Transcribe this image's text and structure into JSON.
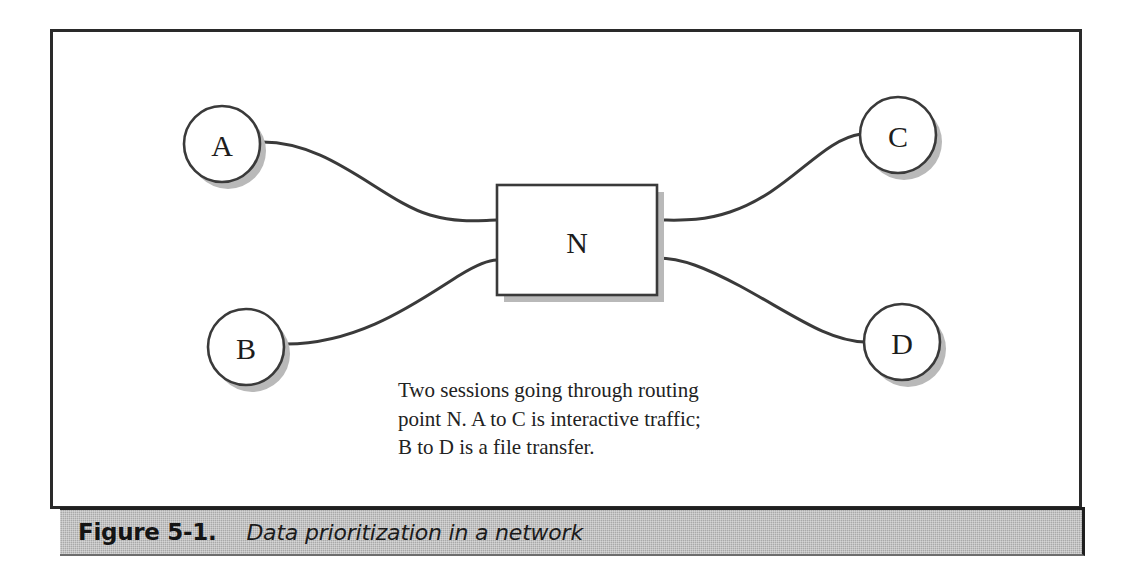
{
  "figure": {
    "caption_label": "Figure 5-1.",
    "caption_title": "Data prioritization in a network",
    "note_lines": [
      "Two sessions going through routing",
      "point N. A to C is interactive traffic;",
      "B to D is a file transfer."
    ],
    "colors": {
      "frame_border": "#2a2a2a",
      "caption_band": "#a9a9a9",
      "line": "#3a3a3a",
      "shadow": "#b9b9b9",
      "text": "#1d1d1d",
      "page_background": "#ffffff"
    }
  },
  "diagram": {
    "type": "network-diagram",
    "nodes": [
      {
        "id": "A",
        "label": "A",
        "shape": "circle",
        "cx": 222,
        "cy": 144,
        "r": 38
      },
      {
        "id": "B",
        "label": "B",
        "shape": "circle",
        "cx": 246,
        "cy": 347,
        "r": 38
      },
      {
        "id": "C",
        "label": "C",
        "shape": "circle",
        "cx": 898,
        "cy": 135,
        "r": 38
      },
      {
        "id": "D",
        "label": "D",
        "shape": "circle",
        "cx": 902,
        "cy": 342,
        "r": 38
      },
      {
        "id": "N",
        "label": "N",
        "shape": "rectangle",
        "x": 497,
        "y": 185,
        "width": 160,
        "height": 110
      }
    ],
    "links": [
      {
        "id": "A-N",
        "from": "A",
        "to": "N",
        "session": "interactive"
      },
      {
        "id": "B-N",
        "from": "B",
        "to": "N",
        "session": "file-transfer"
      },
      {
        "id": "N-C",
        "from": "N",
        "to": "C",
        "session": "interactive"
      },
      {
        "id": "N-D",
        "from": "N",
        "to": "D",
        "session": "file-transfer"
      }
    ],
    "sessions": [
      {
        "name": "A to C",
        "description": "interactive traffic"
      },
      {
        "name": "B to D",
        "description": "a file transfer"
      }
    ]
  }
}
